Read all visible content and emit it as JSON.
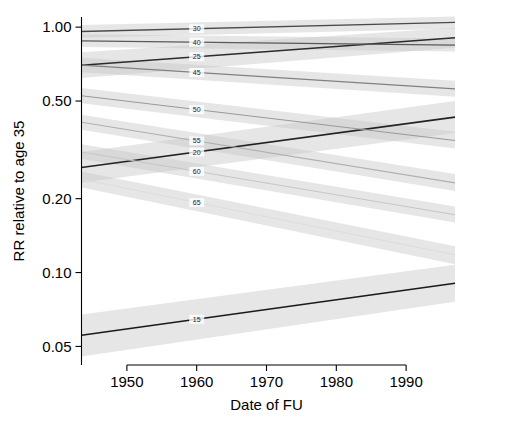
{
  "chart_data": {
    "type": "line",
    "title": "",
    "xlabel": "Date of FU",
    "ylabel": "RR relative to age 35",
    "x_ticks": [
      1950,
      1960,
      1970,
      1980,
      1990
    ],
    "x_tick_labels": [
      "1950",
      "1960",
      "1970",
      "1980",
      "1990"
    ],
    "xlim": [
      1943.5,
      1997.0
    ],
    "y_ticks": [
      1.0,
      0.5,
      0.2,
      0.1,
      0.05
    ],
    "y_tick_labels": [
      "1.00",
      "0.50",
      "0.20",
      "0.10",
      "0.05"
    ],
    "ylim": [
      0.042,
      1.1
    ],
    "y_scale": "log",
    "grid": false,
    "legend_position": "inline-labels",
    "label_x": 1960,
    "band_color": "#c8c8c8",
    "band_opacity": 0.45,
    "series": [
      {
        "name": "15",
        "label": "15",
        "color": "#1a1a1a",
        "linewidth": 1.6,
        "x": [
          1943.5,
          1997.0
        ],
        "values": [
          0.0555,
          0.0905
        ],
        "band_lower": [
          0.0455,
          0.076
        ],
        "band_upper": [
          0.0675,
          0.1075
        ],
        "band": true
      },
      {
        "name": "20",
        "label": "20",
        "color": "#222222",
        "linewidth": 1.6,
        "x": [
          1943.5,
          1997.0
        ],
        "values": [
          0.268,
          0.43
        ],
        "band_lower": [
          0.232,
          0.37
        ],
        "band_upper": [
          0.31,
          0.5
        ],
        "band": true
      },
      {
        "name": "25",
        "label": "25",
        "color": "#2b2b2b",
        "linewidth": 1.5,
        "x": [
          1943.5,
          1997.0
        ],
        "values": [
          0.7,
          0.905
        ],
        "band_lower": [
          0.62,
          0.825
        ],
        "band_upper": [
          0.79,
          0.995
        ],
        "band": true
      },
      {
        "name": "30",
        "label": "30",
        "color": "#4a4a4a",
        "linewidth": 1.3,
        "x": [
          1943.5,
          1997.0
        ],
        "values": [
          0.96,
          1.045
        ],
        "band_lower": [
          0.905,
          0.985
        ],
        "band_upper": [
          1.02,
          1.105
        ],
        "band": true
      },
      {
        "name": "40",
        "label": "40",
        "color": "#5a5a5a",
        "linewidth": 1.3,
        "x": [
          1943.5,
          1997.0
        ],
        "values": [
          0.88,
          0.845
        ],
        "band_lower": [
          0.83,
          0.795
        ],
        "band_upper": [
          0.935,
          0.9
        ],
        "band": true
      },
      {
        "name": "45",
        "label": "45",
        "color": "#808080",
        "linewidth": 1.2,
        "x": [
          1943.5,
          1997.0
        ],
        "values": [
          0.7,
          0.56
        ],
        "band_lower": [
          0.655,
          0.52
        ],
        "band_upper": [
          0.75,
          0.605
        ],
        "band": true
      },
      {
        "name": "50",
        "label": "50",
        "color": "#9a9a9a",
        "linewidth": 1.1,
        "x": [
          1943.5,
          1997.0
        ],
        "values": [
          0.525,
          0.345
        ],
        "band_lower": [
          0.49,
          0.32
        ],
        "band_upper": [
          0.565,
          0.375
        ],
        "band": true
      },
      {
        "name": "55",
        "label": "55",
        "color": "#b0b0b0",
        "linewidth": 1.1,
        "x": [
          1943.5,
          1997.0
        ],
        "values": [
          0.41,
          0.232
        ],
        "band_lower": [
          0.382,
          0.215
        ],
        "band_upper": [
          0.44,
          0.252
        ],
        "band": true
      },
      {
        "name": "60",
        "label": "60",
        "color": "#c6c6c6",
        "linewidth": 1.0,
        "x": [
          1943.5,
          1997.0
        ],
        "values": [
          0.31,
          0.172
        ],
        "band_lower": [
          0.29,
          0.16
        ],
        "band_upper": [
          0.333,
          0.186
        ],
        "band": true
      },
      {
        "name": "65",
        "label": "65",
        "color": "#dcdcdc",
        "linewidth": 1.0,
        "x": [
          1943.5,
          1997.0
        ],
        "values": [
          0.24,
          0.118
        ],
        "band_lower": [
          0.222,
          0.108
        ],
        "band_upper": [
          0.258,
          0.128
        ],
        "band": true
      }
    ]
  },
  "axes": {
    "x_title": "Date of FU",
    "y_title": "RR relative to age 35"
  }
}
